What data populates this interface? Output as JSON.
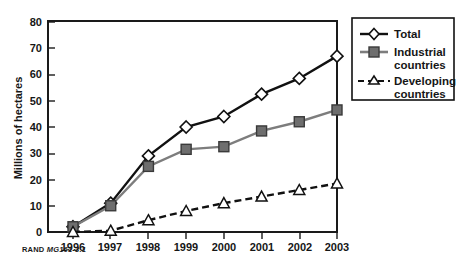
{
  "chart_data": {
    "type": "line",
    "title": "",
    "xlabel": "",
    "ylabel": "Millions of hectares",
    "categories": [
      "1996",
      "1997",
      "1998",
      "1999",
      "2000",
      "2001",
      "2002",
      "2003"
    ],
    "ylim": [
      0,
      80
    ],
    "yticks": [
      0,
      10,
      20,
      30,
      40,
      50,
      60,
      70,
      80
    ],
    "grid": false,
    "legend_position": "right",
    "series": [
      {
        "name": "Total",
        "values": [
          2,
          11,
          29,
          40,
          44,
          52.5,
          58.5,
          67
        ],
        "marker": "diamond",
        "line_style": "solid",
        "color": "#111111"
      },
      {
        "name": "Industrial countries",
        "values": [
          2,
          10,
          25,
          31.5,
          32.5,
          38.5,
          42,
          46.5
        ],
        "marker": "square",
        "line_style": "solid",
        "color": "#7d7d7d"
      },
      {
        "name": "Developing countries",
        "values": [
          0,
          0.5,
          4.5,
          8,
          11,
          13.5,
          16,
          18.5
        ],
        "marker": "triangle",
        "line_style": "dashed",
        "color": "#111111"
      }
    ]
  },
  "legend": {
    "entries": [
      {
        "label_line1": "Total",
        "label_line2": ""
      },
      {
        "label_line1": "Industrial",
        "label_line2": "countries"
      },
      {
        "label_line1": "Developing",
        "label_line2": "countries"
      }
    ]
  },
  "caption": {
    "source": "RAND",
    "figure_id": "MG161-3.1"
  }
}
